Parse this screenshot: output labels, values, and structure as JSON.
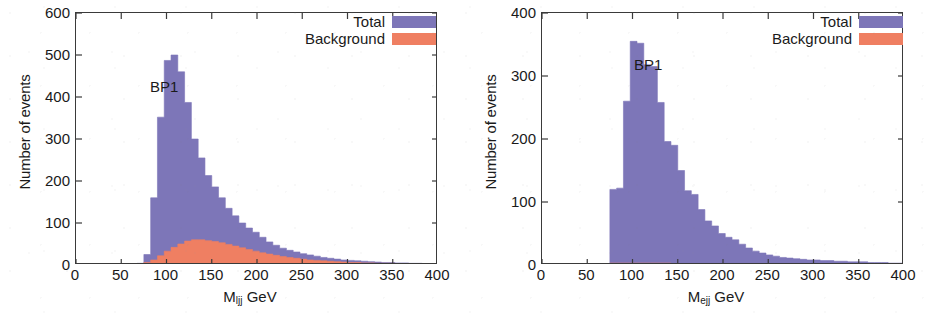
{
  "figure": {
    "background_color": "#ffffff",
    "axis_color": "#3a3a3a",
    "total_color": "#7d76b8",
    "background_color_series": "#ef7f62"
  },
  "panels": [
    {
      "id": "left",
      "annotation": "BP1",
      "legend": {
        "total_label": "Total",
        "background_label": "Background"
      },
      "ylabel": "Number of events",
      "xlabel_main": "M",
      "xlabel_sub": "ljj",
      "xlabel_unit": " GeV",
      "yticks": [
        "0",
        "100",
        "200",
        "300",
        "400",
        "500",
        "600"
      ],
      "xticks": [
        "0",
        "50",
        "100",
        "150",
        "200",
        "250",
        "300",
        "350",
        "400"
      ]
    },
    {
      "id": "right",
      "annotation": "BP1",
      "legend": {
        "total_label": "Total",
        "background_label": "Background"
      },
      "ylabel": "Number of events",
      "xlabel_main": "M",
      "xlabel_sub": "ejj",
      "xlabel_unit": " GeV",
      "yticks": [
        "0",
        "100",
        "200",
        "300",
        "400"
      ],
      "xticks": [
        "0",
        "50",
        "100",
        "150",
        "200",
        "250",
        "300",
        "350",
        "400"
      ]
    }
  ],
  "chart_data": [
    {
      "type": "bar",
      "title": "",
      "annotation": "BP1",
      "xlabel": "M_ljj GeV",
      "ylabel": "Number of events",
      "xlim": [
        0,
        400
      ],
      "ylim": [
        0,
        600
      ],
      "xticks": [
        0,
        50,
        100,
        150,
        200,
        250,
        300,
        350,
        400
      ],
      "yticks": [
        0,
        100,
        200,
        300,
        400,
        500,
        600
      ],
      "grid": false,
      "legend_position": "top-right",
      "bin_width": 7.5,
      "bin_edges": [
        60,
        67.5,
        75,
        82.5,
        90,
        97.5,
        105,
        112.5,
        120,
        127.5,
        135,
        142.5,
        150,
        157.5,
        165,
        172.5,
        180,
        187.5,
        195,
        202.5,
        210,
        217.5,
        225,
        232.5,
        240,
        247.5,
        255,
        262.5,
        270,
        277.5,
        285,
        292.5,
        300,
        307.5,
        315,
        322.5,
        330,
        337.5,
        345,
        352.5,
        360,
        367.5,
        375,
        382.5,
        390,
        397.5,
        400
      ],
      "series": [
        {
          "name": "Total",
          "color": "#7d76b8",
          "values": [
            2,
            4,
            25,
            160,
            352,
            487,
            500,
            460,
            387,
            300,
            255,
            213,
            186,
            160,
            135,
            117,
            100,
            88,
            78,
            66,
            55,
            47,
            40,
            35,
            31,
            27,
            24,
            21,
            18,
            16,
            14,
            12,
            11,
            10,
            9,
            8,
            7,
            6,
            6,
            5,
            5,
            4,
            4,
            3,
            3,
            3
          ]
        },
        {
          "name": "Background",
          "color": "#ef7f62",
          "values": [
            1,
            2,
            6,
            12,
            22,
            33,
            42,
            50,
            57,
            60,
            60,
            58,
            56,
            53,
            49,
            45,
            41,
            37,
            33,
            29,
            26,
            23,
            20,
            18,
            16,
            14,
            12,
            11,
            10,
            9,
            8,
            7,
            6,
            6,
            5,
            5,
            4,
            4,
            4,
            3,
            3,
            3,
            3,
            2,
            2,
            2
          ]
        }
      ]
    },
    {
      "type": "bar",
      "title": "",
      "annotation": "BP1",
      "xlabel": "M_ejj GeV",
      "ylabel": "Number of events",
      "xlim": [
        0,
        400
      ],
      "ylim": [
        0,
        400
      ],
      "xticks": [
        0,
        50,
        100,
        150,
        200,
        250,
        300,
        350,
        400
      ],
      "yticks": [
        0,
        100,
        200,
        300,
        400
      ],
      "grid": false,
      "legend_position": "top-right",
      "bin_width": 7.5,
      "bin_edges": [
        75,
        82.5,
        90,
        97.5,
        105,
        112.5,
        120,
        127.5,
        135,
        142.5,
        150,
        157.5,
        165,
        172.5,
        180,
        187.5,
        195,
        202.5,
        210,
        217.5,
        225,
        232.5,
        240,
        247.5,
        255,
        262.5,
        270,
        277.5,
        285,
        292.5,
        300,
        307.5,
        315,
        322.5,
        330,
        337.5,
        345,
        352.5,
        360,
        367.5,
        375,
        382.5,
        390,
        397.5,
        400
      ],
      "series": [
        {
          "name": "Total",
          "color": "#7d76b8",
          "values": [
            120,
            122,
            260,
            355,
            352,
            318,
            315,
            258,
            196,
            190,
            150,
            118,
            112,
            88,
            70,
            62,
            50,
            44,
            40,
            33,
            27,
            22,
            19,
            16,
            14,
            12,
            11,
            10,
            9,
            8,
            8,
            7,
            7,
            6,
            6,
            5,
            5,
            5,
            4,
            4,
            4,
            3,
            3,
            3
          ]
        },
        {
          "name": "Background",
          "color": "#ef7f62",
          "values": [
            3,
            3,
            3,
            3,
            3,
            3,
            3,
            3,
            3,
            2,
            2,
            2,
            2,
            2,
            2,
            2,
            2,
            2,
            2,
            2,
            2,
            1,
            1,
            1,
            1,
            1,
            1,
            1,
            1,
            1,
            1,
            1,
            1,
            1,
            1,
            1,
            1,
            1,
            1,
            1,
            1,
            1,
            1,
            1
          ]
        }
      ]
    }
  ]
}
